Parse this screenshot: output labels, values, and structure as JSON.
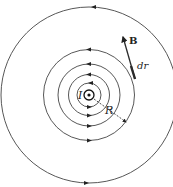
{
  "diagram": {
    "center": {
      "x": 89,
      "y": 95
    },
    "field_line_radii": [
      12,
      20.5,
      31,
      45.5,
      88
    ],
    "colors": {
      "line": "#333333",
      "vector": "#2a2a2a",
      "background": "#ffffff"
    },
    "labels": {
      "current": "I",
      "radius": "R",
      "field": "B",
      "displacement": "dr"
    },
    "current_direction": "out-of-page",
    "field_direction": "counter-clockwise"
  }
}
